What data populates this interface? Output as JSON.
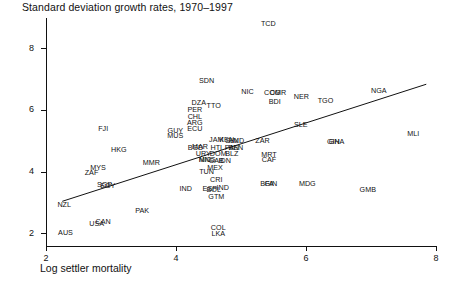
{
  "chart_data": {
    "type": "scatter",
    "title": "Standard deviation growth rates, 1970–1997",
    "xlabel": "Log settler mortality",
    "ylabel": "",
    "xlim": [
      2,
      8
    ],
    "ylim": [
      1.6,
      9.0
    ],
    "xticks": [
      2,
      4,
      6,
      8
    ],
    "yticks": [
      2,
      4,
      6,
      8
    ],
    "grid": false,
    "legend": null,
    "marker_style": "text-label",
    "labels_are_markers": true,
    "fit_line": {
      "name": "regression line",
      "x": [
        2.25,
        7.85
      ],
      "y": [
        3.05,
        6.85
      ],
      "color": "#111111"
    },
    "points": [
      {
        "label": "TCD",
        "x": 5.42,
        "y": 8.8
      },
      {
        "label": "SDN",
        "x": 4.47,
        "y": 6.95
      },
      {
        "label": "NIC",
        "x": 5.1,
        "y": 6.6
      },
      {
        "label": "COG",
        "x": 5.48,
        "y": 6.55
      },
      {
        "label": "CMR",
        "x": 5.57,
        "y": 6.55
      },
      {
        "label": "NER",
        "x": 5.93,
        "y": 6.45
      },
      {
        "label": "NGA",
        "x": 7.12,
        "y": 6.62
      },
      {
        "label": "TGO",
        "x": 6.3,
        "y": 6.3
      },
      {
        "label": "BDI",
        "x": 5.52,
        "y": 6.28
      },
      {
        "label": "DZA",
        "x": 4.35,
        "y": 6.25
      },
      {
        "label": "TTO",
        "x": 4.58,
        "y": 6.15
      },
      {
        "label": "PER",
        "x": 4.29,
        "y": 6.02
      },
      {
        "label": "CHL",
        "x": 4.29,
        "y": 5.8
      },
      {
        "label": "ARG",
        "x": 4.29,
        "y": 5.58
      },
      {
        "label": "ECU",
        "x": 4.29,
        "y": 5.4
      },
      {
        "label": "FJI",
        "x": 2.88,
        "y": 5.4
      },
      {
        "label": "GUY",
        "x": 3.99,
        "y": 5.32
      },
      {
        "label": "MUS",
        "x": 3.99,
        "y": 5.18
      },
      {
        "label": "SLE",
        "x": 5.92,
        "y": 5.52
      },
      {
        "label": "MLI",
        "x": 7.65,
        "y": 5.22
      },
      {
        "label": "ZAR",
        "x": 5.33,
        "y": 5.0
      },
      {
        "label": "GIN",
        "x": 6.42,
        "y": 4.98
      },
      {
        "label": "GHA",
        "x": 6.47,
        "y": 4.98
      },
      {
        "label": "HKG",
        "x": 3.12,
        "y": 4.72
      },
      {
        "label": "JAM",
        "x": 4.62,
        "y": 5.05
      },
      {
        "label": "KEN",
        "x": 4.78,
        "y": 5.03
      },
      {
        "label": "SLV",
        "x": 4.86,
        "y": 5.02
      },
      {
        "label": "HND",
        "x": 4.93,
        "y": 5.0
      },
      {
        "label": "MAR",
        "x": 4.37,
        "y": 4.82
      },
      {
        "label": "BGD",
        "x": 4.3,
        "y": 4.78
      },
      {
        "label": "HTI",
        "x": 4.62,
        "y": 4.78
      },
      {
        "label": "PAN",
        "x": 4.86,
        "y": 4.78
      },
      {
        "label": "BEN",
        "x": 4.92,
        "y": 4.78
      },
      {
        "label": "URY",
        "x": 4.42,
        "y": 4.58
      },
      {
        "label": "DOM",
        "x": 4.65,
        "y": 4.58
      },
      {
        "label": "BLZ",
        "x": 4.86,
        "y": 4.57
      },
      {
        "label": "MRT",
        "x": 5.43,
        "y": 4.55
      },
      {
        "label": "NIC2",
        "x": 4.45,
        "y": 4.4
      },
      {
        "label": "MNG",
        "x": 4.48,
        "y": 4.38
      },
      {
        "label": "GAB",
        "x": 4.62,
        "y": 4.35
      },
      {
        "label": "CAF",
        "x": 5.43,
        "y": 4.38
      },
      {
        "label": "IDN",
        "x": 4.75,
        "y": 4.35
      },
      {
        "label": "MMR",
        "x": 3.62,
        "y": 4.28
      },
      {
        "label": "MEX",
        "x": 4.6,
        "y": 4.12
      },
      {
        "label": "MYS",
        "x": 2.8,
        "y": 4.12
      },
      {
        "label": "TUN",
        "x": 4.47,
        "y": 4.0
      },
      {
        "label": "ZAF",
        "x": 2.7,
        "y": 3.98
      },
      {
        "label": "CRI",
        "x": 4.62,
        "y": 3.75
      },
      {
        "label": "SGP",
        "x": 2.9,
        "y": 3.58
      },
      {
        "label": "EGY",
        "x": 2.95,
        "y": 3.55
      },
      {
        "label": "BFA",
        "x": 5.4,
        "y": 3.62
      },
      {
        "label": "GIN2",
        "x": 5.46,
        "y": 3.62
      },
      {
        "label": "MDG",
        "x": 6.02,
        "y": 3.6
      },
      {
        "label": "GMB",
        "x": 6.95,
        "y": 3.42
      },
      {
        "label": "IND",
        "x": 4.15,
        "y": 3.45
      },
      {
        "label": "ESP",
        "x": 4.52,
        "y": 3.45
      },
      {
        "label": "BOL",
        "x": 4.58,
        "y": 3.42
      },
      {
        "label": "IND2",
        "x": 4.72,
        "y": 3.48
      },
      {
        "label": "GTM",
        "x": 4.62,
        "y": 3.18
      },
      {
        "label": "NZL",
        "x": 2.28,
        "y": 2.92
      },
      {
        "label": "PAK",
        "x": 3.48,
        "y": 2.72
      },
      {
        "label": "USA",
        "x": 2.78,
        "y": 2.32
      },
      {
        "label": "CAN",
        "x": 2.88,
        "y": 2.38
      },
      {
        "label": "AUS",
        "x": 2.3,
        "y": 2.02
      },
      {
        "label": "COL",
        "x": 4.65,
        "y": 2.18
      },
      {
        "label": "LKA",
        "x": 4.65,
        "y": 2.0
      }
    ]
  }
}
